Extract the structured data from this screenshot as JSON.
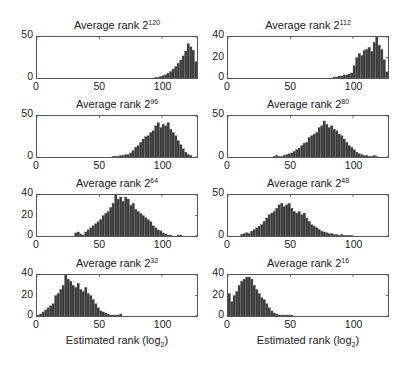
{
  "figure": {
    "xlabel": "Estimated rank (log",
    "xlabel_sub": "2",
    "xlabel_end": ")"
  },
  "chart_data": [
    {
      "type": "bar",
      "title": "Average rank 2^120",
      "title_base": "Average rank 2",
      "title_exp": "120",
      "xlabel": "",
      "ylabel": "",
      "xlim": [
        0,
        128
      ],
      "ylim": [
        0,
        50
      ],
      "xticks": [
        0,
        50,
        100
      ],
      "yticks": [
        0,
        50
      ],
      "bins": [
        95,
        97,
        99,
        101,
        103,
        105,
        107,
        109,
        111,
        113,
        115,
        117,
        119,
        121,
        123,
        125,
        127
      ],
      "values": [
        1,
        1,
        2,
        3,
        4,
        6,
        8,
        11,
        14,
        18,
        22,
        27,
        33,
        42,
        38,
        34,
        20
      ]
    },
    {
      "type": "bar",
      "title": "Average rank 2^112",
      "title_base": "Average rank 2",
      "title_exp": "112",
      "xlabel": "",
      "ylabel": "",
      "xlim": [
        0,
        128
      ],
      "ylim": [
        0,
        40
      ],
      "xticks": [
        0,
        50,
        100
      ],
      "yticks": [
        0,
        20,
        40
      ],
      "bins": [
        85,
        87,
        89,
        91,
        93,
        95,
        97,
        99,
        101,
        103,
        105,
        107,
        109,
        111,
        113,
        115,
        117,
        119,
        121,
        123,
        125,
        127
      ],
      "values": [
        1,
        1,
        2,
        2,
        3,
        3,
        4,
        5,
        12,
        20,
        24,
        22,
        27,
        28,
        30,
        26,
        35,
        40,
        32,
        28,
        18,
        6
      ]
    },
    {
      "type": "bar",
      "title": "Average rank 2^96",
      "title_base": "Average rank 2",
      "title_exp": "96",
      "xlabel": "",
      "ylabel": "",
      "xlim": [
        0,
        128
      ],
      "ylim": [
        0,
        50
      ],
      "xticks": [
        0,
        50,
        100
      ],
      "yticks": [
        0,
        50
      ],
      "bins": [
        61,
        63,
        65,
        67,
        69,
        71,
        73,
        75,
        77,
        79,
        81,
        83,
        85,
        87,
        89,
        91,
        93,
        95,
        97,
        99,
        101,
        103,
        105,
        107,
        109,
        111,
        113,
        115,
        117,
        119,
        121,
        123
      ],
      "values": [
        1,
        1,
        1,
        2,
        2,
        3,
        3,
        5,
        8,
        12,
        14,
        18,
        22,
        25,
        26,
        30,
        32,
        38,
        42,
        36,
        40,
        38,
        42,
        34,
        30,
        26,
        20,
        15,
        10,
        6,
        3,
        2
      ]
    },
    {
      "type": "bar",
      "title": "Average rank 2^80",
      "title_base": "Average rank 2",
      "title_exp": "80",
      "xlabel": "",
      "ylabel": "",
      "xlim": [
        0,
        128
      ],
      "ylim": [
        0,
        50
      ],
      "xticks": [
        0,
        50,
        100
      ],
      "yticks": [
        0,
        50
      ],
      "bins": [
        37,
        39,
        41,
        43,
        45,
        47,
        49,
        51,
        53,
        55,
        57,
        59,
        61,
        63,
        65,
        67,
        69,
        71,
        73,
        75,
        77,
        79,
        81,
        83,
        85,
        87,
        89,
        91,
        93,
        95,
        97,
        99,
        101,
        103,
        105,
        107,
        109,
        111,
        113,
        115,
        117,
        119
      ],
      "values": [
        1,
        2,
        1,
        1,
        2,
        3,
        4,
        5,
        7,
        9,
        11,
        14,
        17,
        18,
        24,
        26,
        28,
        30,
        36,
        38,
        44,
        40,
        36,
        38,
        34,
        32,
        28,
        26,
        22,
        18,
        14,
        12,
        9,
        6,
        4,
        3,
        2,
        2,
        1,
        1,
        2,
        1
      ]
    },
    {
      "type": "bar",
      "title": "Average rank 2^64",
      "title_base": "Average rank 2",
      "title_exp": "64",
      "xlabel": "",
      "ylabel": "",
      "xlim": [
        0,
        128
      ],
      "ylim": [
        0,
        40
      ],
      "xticks": [
        0,
        50,
        100
      ],
      "yticks": [
        0,
        20,
        40
      ],
      "bins": [
        31,
        33,
        35,
        37,
        39,
        41,
        43,
        45,
        47,
        49,
        51,
        53,
        55,
        57,
        59,
        61,
        63,
        65,
        67,
        69,
        71,
        73,
        75,
        77,
        79,
        81,
        83,
        85,
        87,
        89,
        91,
        93,
        95,
        97,
        99,
        101,
        103,
        105,
        107,
        113,
        115
      ],
      "values": [
        3,
        4,
        2,
        1,
        4,
        6,
        8,
        10,
        12,
        14,
        16,
        20,
        22,
        24,
        28,
        32,
        40,
        36,
        38,
        34,
        38,
        36,
        30,
        32,
        26,
        24,
        22,
        20,
        18,
        16,
        14,
        10,
        8,
        6,
        5,
        3,
        2,
        1,
        1,
        1,
        1
      ]
    },
    {
      "type": "bar",
      "title": "Average rank 2^48",
      "title_base": "Average rank 2",
      "title_exp": "48",
      "xlabel": "",
      "ylabel": "",
      "xlim": [
        0,
        128
      ],
      "ylim": [
        0,
        50
      ],
      "xticks": [
        0,
        50,
        100
      ],
      "yticks": [
        0,
        50
      ],
      "bins": [
        11,
        13,
        15,
        17,
        19,
        21,
        23,
        25,
        27,
        29,
        31,
        33,
        35,
        37,
        39,
        41,
        43,
        45,
        47,
        49,
        51,
        53,
        55,
        57,
        59,
        61,
        63,
        65,
        67,
        69,
        71,
        73,
        75,
        77,
        79,
        81,
        83,
        85,
        87,
        89,
        91,
        93,
        95,
        97,
        99
      ],
      "values": [
        2,
        3,
        4,
        3,
        6,
        8,
        10,
        12,
        14,
        18,
        22,
        26,
        28,
        30,
        34,
        38,
        40,
        36,
        38,
        40,
        34,
        30,
        28,
        30,
        26,
        28,
        22,
        18,
        14,
        12,
        10,
        8,
        6,
        5,
        4,
        3,
        3,
        2,
        2,
        1,
        2,
        1,
        1,
        1,
        1
      ]
    },
    {
      "type": "bar",
      "title": "Average rank 2^32",
      "title_base": "Average rank 2",
      "title_exp": "32",
      "xlabel": "Estimated rank (log2)",
      "ylabel": "",
      "xlim": [
        0,
        128
      ],
      "ylim": [
        0,
        40
      ],
      "xticks": [
        0,
        50,
        100
      ],
      "yticks": [
        0,
        20,
        40
      ],
      "bins": [
        1,
        3,
        5,
        7,
        9,
        11,
        13,
        15,
        17,
        19,
        21,
        23,
        25,
        27,
        29,
        31,
        33,
        35,
        37,
        39,
        41,
        43,
        45,
        47,
        49,
        51,
        53,
        55,
        57,
        59,
        61,
        63,
        65,
        67
      ],
      "values": [
        1,
        2,
        4,
        6,
        8,
        10,
        12,
        20,
        22,
        26,
        30,
        40,
        36,
        34,
        30,
        28,
        32,
        26,
        24,
        28,
        22,
        20,
        16,
        12,
        8,
        5,
        4,
        3,
        2,
        1,
        1,
        1,
        1,
        2
      ]
    },
    {
      "type": "bar",
      "title": "Average rank 2^16",
      "title_base": "Average rank 2",
      "title_exp": "16",
      "xlabel": "Estimated rank (log2)",
      "ylabel": "",
      "xlim": [
        0,
        128
      ],
      "ylim": [
        0,
        40
      ],
      "xticks": [
        0,
        50,
        100
      ],
      "yticks": [
        0,
        20,
        40
      ],
      "bins": [
        1,
        3,
        5,
        7,
        9,
        11,
        13,
        15,
        17,
        19,
        21,
        23,
        25,
        27,
        29,
        31,
        33,
        35,
        37,
        39,
        41,
        43,
        45,
        47,
        49,
        51
      ],
      "values": [
        22,
        14,
        20,
        24,
        30,
        34,
        36,
        38,
        38,
        36,
        30,
        26,
        22,
        18,
        16,
        12,
        8,
        5,
        3,
        2,
        1,
        1,
        1,
        1,
        1,
        1
      ]
    }
  ]
}
